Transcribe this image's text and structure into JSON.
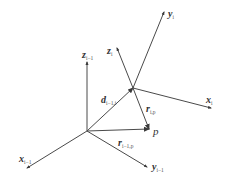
{
  "diagram": {
    "colors": {
      "line": "#4a4a4a",
      "text": "#333333",
      "background": "#ffffff"
    },
    "points": {
      "O_prev": [
        87,
        131
      ],
      "O_i": [
        133,
        88
      ],
      "p": [
        149,
        129
      ]
    },
    "frame_prev": {
      "x_axis": {
        "end": [
          27,
          168
        ],
        "label": "x",
        "sub": "i−1"
      },
      "y_axis": {
        "end": [
          147,
          167
        ],
        "label": "y",
        "sub": "i−1"
      },
      "z_axis": {
        "end": [
          87,
          62
        ],
        "label": "z",
        "sub": "i−1"
      }
    },
    "frame_i": {
      "x_axis": {
        "end": [
          211,
          108
        ],
        "label": "x",
        "sub": "i"
      },
      "y_axis": {
        "end": [
          164,
          12
        ],
        "label": "y",
        "sub": "i"
      },
      "z_axis": {
        "end": [
          117,
          48
        ],
        "label": "z",
        "sub": "i"
      }
    },
    "vectors": {
      "d": {
        "label": "d",
        "sub": "i−1,i"
      },
      "r_i_p": {
        "label": "r",
        "sub": "i,p"
      },
      "r_prev_p": {
        "label": "r",
        "sub": "i−1,p"
      }
    },
    "point_label": "p"
  }
}
